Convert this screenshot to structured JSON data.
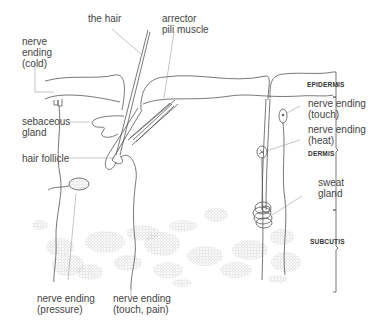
{
  "diagram": {
    "labels": {
      "the_hair": "the hair",
      "arrector_1": "arrector",
      "arrector_2": "pili muscle",
      "cold_1": "nerve",
      "cold_2": "ending",
      "cold_3": "(cold)",
      "sebaceous_1": "sebaceous",
      "sebaceous_2": "gland",
      "hair_follicle": "hair follicle",
      "touch_1": "nerve ending",
      "touch_2": "(touch)",
      "heat_1": "nerve ending",
      "heat_2": "(heat)",
      "sweat_1": "sweat",
      "sweat_2": "gland",
      "pressure_1": "nerve ending",
      "pressure_2": "(pressure)",
      "touch_pain_1": "nerve ending",
      "touch_pain_2": "(touch, pain)"
    },
    "layers": {
      "epidermis": "EPIDERMIS",
      "dermis": "DERMIS",
      "subcutis": "SUBCUTIS"
    },
    "colors": {
      "outline": "#555555",
      "leader": "#888888",
      "fat": "#bbbbbb",
      "text": "#444444"
    }
  }
}
